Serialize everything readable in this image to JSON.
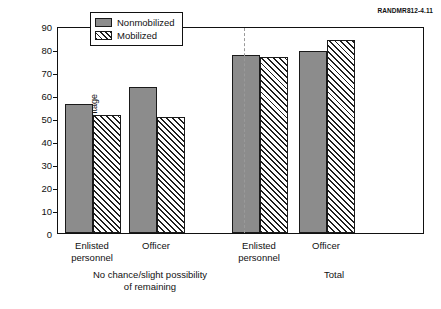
{
  "figure_id": "RANDMR812-4.11",
  "chart_data": {
    "type": "bar",
    "title": "",
    "xlabel": "",
    "ylabel": "Percentage",
    "ylim": [
      0,
      90
    ],
    "yticks": [
      0,
      10,
      20,
      30,
      40,
      50,
      60,
      70,
      80,
      90
    ],
    "grid": false,
    "legend_position": "top-center",
    "categories": [
      "Enlisted personnel",
      "Officer",
      "Enlisted personnel",
      "Officer"
    ],
    "supergroups": [
      {
        "label": "No chance/slight possibility of remaining",
        "categories": [
          "Enlisted personnel",
          "Officer"
        ]
      },
      {
        "label": "Total",
        "categories": [
          "Enlisted personnel",
          "Officer"
        ]
      }
    ],
    "series": [
      {
        "name": "Nonmobilized",
        "style": "solid",
        "color": "#8c8c8c",
        "values": [
          56,
          63.5,
          77.5,
          79
        ]
      },
      {
        "name": "Mobilized",
        "style": "hatched",
        "color": "#ffffff",
        "values": [
          51.5,
          50.5,
          76.5,
          84
        ]
      }
    ]
  },
  "axis": {
    "y_title": "Percentage",
    "ticks": [
      "90",
      "80",
      "70",
      "60",
      "50",
      "40",
      "30",
      "20",
      "10",
      "0"
    ]
  },
  "legend": {
    "items": [
      {
        "label": "Nonmobilized"
      },
      {
        "label": "Mobilized"
      }
    ]
  },
  "x_labels": {
    "groups": [
      {
        "line1": "Enlisted",
        "line2": "personnel"
      },
      {
        "line1": "Officer",
        "line2": ""
      },
      {
        "line1": "Enlisted",
        "line2": "personnel"
      },
      {
        "line1": "Officer",
        "line2": ""
      }
    ],
    "supergroups": [
      {
        "line1": "No chance/slight possibility",
        "line2": "of remaining"
      },
      {
        "line1": "Total",
        "line2": ""
      }
    ]
  }
}
